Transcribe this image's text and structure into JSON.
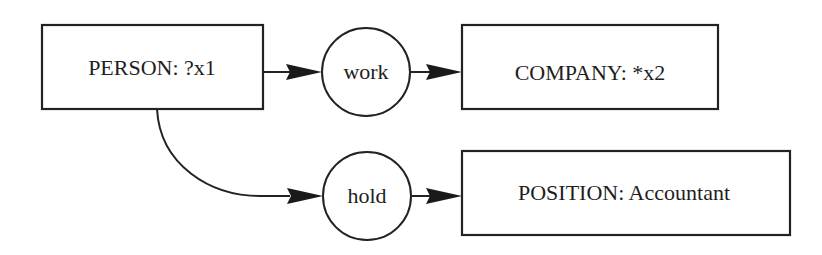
{
  "diagram": {
    "type": "conceptual-graph",
    "concepts": {
      "person": {
        "label": "PERSON: ?x1",
        "type": "PERSON",
        "referent": "?x1"
      },
      "company": {
        "label": "COMPANY: *x2",
        "type": "COMPANY",
        "referent": "*x2"
      },
      "position": {
        "label": "POSITION: Accountant",
        "type": "POSITION",
        "referent": "Accountant"
      }
    },
    "relations": {
      "work": {
        "label": "work"
      },
      "hold": {
        "label": "hold"
      }
    },
    "edges": [
      {
        "from": "PERSON: ?x1",
        "to": "work"
      },
      {
        "from": "work",
        "to": "COMPANY: *x2"
      },
      {
        "from": "PERSON: ?x1",
        "to": "hold"
      },
      {
        "from": "hold",
        "to": "POSITION: Accountant"
      }
    ],
    "colors": {
      "stroke": "#222222",
      "text": "#1e1e1e",
      "background": "#ffffff"
    }
  }
}
